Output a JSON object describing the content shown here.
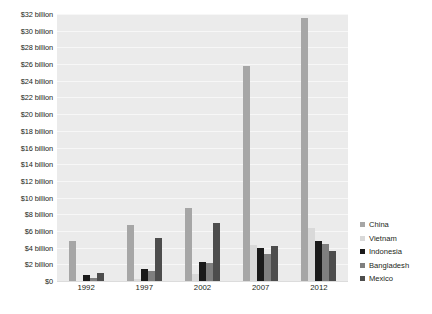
{
  "chart_data": {
    "type": "bar",
    "title": "",
    "xlabel": "",
    "ylabel": "",
    "categories": [
      "1992",
      "1997",
      "2002",
      "2007",
      "2012"
    ],
    "ylim": [
      0,
      32
    ],
    "ytick_values": [
      0,
      2,
      4,
      6,
      8,
      10,
      12,
      14,
      16,
      18,
      20,
      22,
      24,
      26,
      28,
      30,
      32
    ],
    "ytick_labels": [
      "$0",
      "$2 billion",
      "$4 billion",
      "$6 billion",
      "$8 billion",
      "$10 billion",
      "$12 billion",
      "$14 billion",
      "$16 billion",
      "$18 billion",
      "$20 billion",
      "$22 billion",
      "$24 billion",
      "$26 billion",
      "$28 billion",
      "$30 billion",
      "$32 billion"
    ],
    "grid": true,
    "legend_position": "right",
    "units": "billions of US dollars",
    "series": [
      {
        "name": "China",
        "color": "#a6a6a6",
        "values": [
          4.8,
          6.7,
          8.7,
          25.8,
          31.5
        ]
      },
      {
        "name": "Vietnam",
        "color": "#d9d9d9",
        "values": [
          0.0,
          0.3,
          0.9,
          4.3,
          6.3
        ]
      },
      {
        "name": "Indonesia",
        "color": "#1a1a1a",
        "values": [
          0.7,
          1.4,
          2.3,
          3.9,
          4.8
        ]
      },
      {
        "name": "Bangladesh",
        "color": "#7f7f7f",
        "values": [
          0.4,
          1.2,
          2.1,
          3.2,
          4.4
        ]
      },
      {
        "name": "Mexico",
        "color": "#4d4d4d",
        "values": [
          1.0,
          5.1,
          7.0,
          4.2,
          3.6
        ]
      }
    ]
  },
  "legend": {
    "items": [
      {
        "label": "China",
        "color": "#a6a6a6"
      },
      {
        "label": "Vietnam",
        "color": "#d9d9d9"
      },
      {
        "label": "Indonesia",
        "color": "#1a1a1a"
      },
      {
        "label": "Bangladesh",
        "color": "#7f7f7f"
      },
      {
        "label": "Mexico",
        "color": "#4d4d4d"
      }
    ]
  },
  "caption": {
    "text": "FIGURE 12 · Apparel imports to the United States, by country of origin"
  },
  "colors": {
    "plot_background": "#ebebeb",
    "gridline": "#f7f7f7",
    "text": "#231f20",
    "page_background": "#ffffff"
  }
}
